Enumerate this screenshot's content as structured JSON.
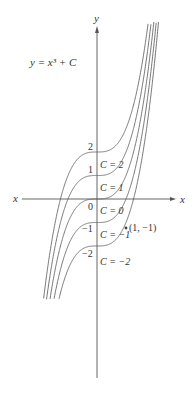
{
  "title": "y = x³ + C",
  "chart_data": {
    "type": "line",
    "xlabel": "x",
    "ylabel": "y",
    "origin_label": "0",
    "series": [
      {
        "name": "C = 2",
        "C": 2
      },
      {
        "name": "C = 1",
        "C": 1
      },
      {
        "name": "C = 0",
        "C": 0
      },
      {
        "name": "C = -1",
        "C": -1
      },
      {
        "name": "C = -2",
        "C": -2
      }
    ],
    "y_ticks": [
      {
        "value": 2,
        "label": "2"
      },
      {
        "value": 1,
        "label": "1"
      },
      {
        "value": 0,
        "label": "0"
      },
      {
        "value": -1,
        "label": "−1"
      },
      {
        "value": -2,
        "label": "−2"
      }
    ],
    "annotations": [
      {
        "text": "(1, −1)",
        "x": 1,
        "y": -1
      }
    ],
    "curve_labels": [
      "C = 2",
      "C = 1",
      "C = 0",
      "C = −1",
      "C = −2"
    ],
    "grid": false,
    "line_color": "#666666"
  }
}
